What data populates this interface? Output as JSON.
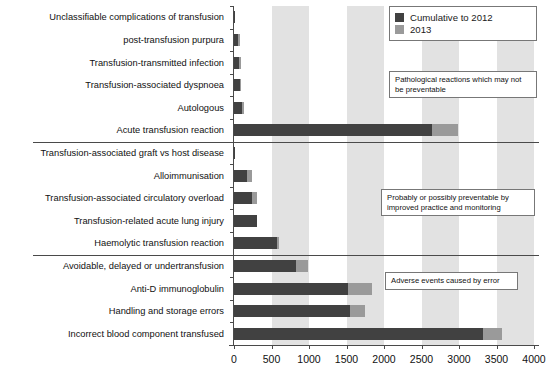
{
  "chart_data": {
    "type": "bar",
    "orientation": "horizontal",
    "stacked": true,
    "title": "",
    "xlabel": "",
    "ylabel": "",
    "xlim": [
      0,
      4000
    ],
    "xticks": [
      0,
      500,
      1000,
      1500,
      2000,
      2500,
      3000,
      3500,
      4000
    ],
    "xticklabels": [
      "0",
      "500",
      "1000",
      "1500",
      "2000",
      "2500",
      "3000",
      "3500",
      "4000"
    ],
    "grid": false,
    "background_bands": "alternating light grey vertical bands every 500 units",
    "legend": {
      "position": "top-right",
      "entries": [
        {
          "name": "Cumulative to 2012",
          "color": "#414141"
        },
        {
          "name": "2013",
          "color": "#9a9a9a"
        }
      ]
    },
    "categories": [
      "Unclassifiable complications of transfusion",
      "post-transfusion purpura",
      "Transfusion-transmitted infection",
      "Transfusion-associated dyspnoea",
      "Autologous",
      "Acute transfusion reaction",
      "Transfusion-associated graft vs host disease",
      "Alloimmunisation",
      "Transfusion-associated circulatory overload",
      "Transfusion-related acute lung injury",
      "Haemolytic transfusion reaction",
      "Avoidable, delayed or undertransfusion",
      "Anti-D immunoglobulin",
      "Handling and storage errors",
      "Incorrect blood component transfused"
    ],
    "series": [
      {
        "name": "Cumulative to 2012",
        "color": "#414141",
        "values": [
          5,
          55,
          70,
          80,
          110,
          2640,
          5,
          175,
          240,
          300,
          575,
          830,
          1520,
          1550,
          3320
        ]
      },
      {
        "name": "2013",
        "color": "#9a9a9a",
        "values": [
          0,
          5,
          5,
          10,
          5,
          350,
          0,
          65,
          70,
          0,
          10,
          160,
          320,
          200,
          250
        ]
      }
    ],
    "annotations": [
      "Pathological reactions which may not be preventable",
      "Probably or possibly preventable by improved practice and monitoring",
      "Adverse events caused by error"
    ],
    "groups": [
      {
        "label": "Pathological reactions which may not be preventable",
        "from": 0,
        "to": 5
      },
      {
        "label": "Probably or possibly preventable by improved practice and monitoring",
        "from": 6,
        "to": 10
      },
      {
        "label": "Adverse events caused by error",
        "from": 11,
        "to": 14
      }
    ]
  }
}
